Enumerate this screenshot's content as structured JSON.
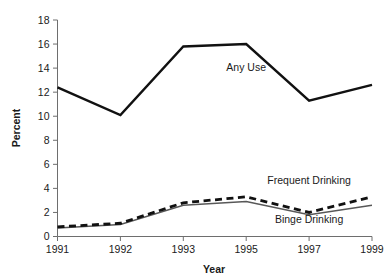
{
  "chart_data": {
    "type": "line",
    "title": "",
    "xlabel": "Year",
    "ylabel": "Percent",
    "categories": [
      "1991",
      "1992",
      "1993",
      "1995",
      "1997",
      "1999"
    ],
    "x_tick_labels": [
      "1991",
      "1992",
      "1993",
      "1995",
      "1997",
      "1999"
    ],
    "y_tick_labels": [
      "0",
      "2",
      "4",
      "6",
      "8",
      "10",
      "12",
      "14",
      "16",
      "18"
    ],
    "y_ticks": [
      0,
      2,
      4,
      6,
      8,
      10,
      12,
      14,
      16,
      18
    ],
    "ylim": [
      0,
      18
    ],
    "grid": false,
    "legend_position": "inline-annotations",
    "series": [
      {
        "name": "Any Use",
        "style": "solid-thick",
        "color": "#111111",
        "values": [
          12.4,
          10.1,
          15.8,
          16.0,
          11.3,
          12.6
        ],
        "label": "Any Use",
        "label_x": 1995,
        "label_y": 13.8
      },
      {
        "name": "Frequent Drinking",
        "style": "dashed",
        "color": "#111111",
        "values": [
          0.8,
          1.1,
          2.8,
          3.3,
          2.0,
          3.3
        ],
        "label": "Frequent Drinking",
        "label_x": 1997,
        "label_y": 4.4
      },
      {
        "name": "Binge Drinking",
        "style": "solid-thin",
        "color": "#585858",
        "values": [
          0.7,
          1.0,
          2.6,
          2.9,
          1.8,
          2.6
        ],
        "label": "Binge Drinking",
        "label_x": 1997,
        "label_y": 1.1
      }
    ],
    "annotations": [
      {
        "text": "Any Use",
        "series": "Any Use"
      },
      {
        "text": "Frequent Drinking",
        "series": "Frequent Drinking"
      },
      {
        "text": "Binge Drinking",
        "series": "Binge Drinking"
      }
    ]
  }
}
